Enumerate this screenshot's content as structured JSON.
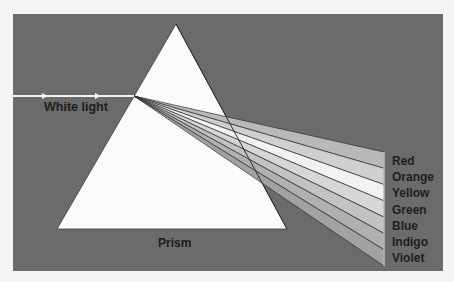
{
  "diagram": {
    "labels": {
      "incoming": "White light",
      "prism": "Prism"
    },
    "spectrum": [
      {
        "name": "Red",
        "shade": "#b9b9b9"
      },
      {
        "name": "Orange",
        "shade": "#cfcfcf"
      },
      {
        "name": "Yellow",
        "shade": "#f2f2f2"
      },
      {
        "name": "Green",
        "shade": "#d6d6d6"
      },
      {
        "name": "Blue",
        "shade": "#c2c2c2"
      },
      {
        "name": "Indigo",
        "shade": "#b0b0b0"
      },
      {
        "name": "Violet",
        "shade": "#a2a2a2"
      }
    ],
    "colors": {
      "page_background": "#f4f4f2",
      "panel": "#6b6b6b",
      "prism_fill": "#fbfbfb",
      "beam": "#f2f2f2",
      "band_edge": "#2e2e2e",
      "label_text": "#1e1e1e"
    }
  }
}
